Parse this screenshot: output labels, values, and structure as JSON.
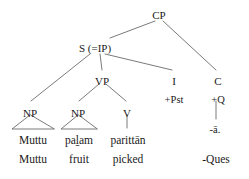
{
  "figure": {
    "type": "syntax-tree",
    "language_example": "Tamil",
    "canvas": {
      "width": 249,
      "height": 179
    },
    "line_color": "#6b6b6b",
    "text_color": "#1a1a1a",
    "background_color": "#ffffff"
  },
  "nodes": {
    "cp": {
      "label": "CP",
      "x": 159,
      "y": 10
    },
    "s_ip": {
      "label": "S (=IP)",
      "x": 95,
      "y": 43
    },
    "vp": {
      "label": "VP",
      "x": 102,
      "y": 76
    },
    "i": {
      "label": "I",
      "x": 174,
      "y": 76
    },
    "c": {
      "label": "C",
      "x": 218,
      "y": 76
    },
    "np1": {
      "label": "NP",
      "x": 30,
      "y": 108
    },
    "np2": {
      "label": "NP",
      "x": 78,
      "y": 108
    },
    "v": {
      "label": "V",
      "x": 127,
      "y": 108
    }
  },
  "features": {
    "i_feature": {
      "label": "+Pst",
      "x": 174,
      "y": 94
    },
    "c_feature": {
      "label": "+Q",
      "x": 218,
      "y": 94
    },
    "c_morpheme": {
      "label": "-ā.",
      "x": 215,
      "y": 124
    }
  },
  "terminals": [
    {
      "label": "Muttu",
      "x": 33,
      "y": 134
    },
    {
      "label": "pal̠am",
      "x": 79,
      "y": 134
    },
    {
      "label": "parittān",
      "x": 128,
      "y": 134
    }
  ],
  "glosses": [
    {
      "label": "Muttu",
      "x": 33,
      "y": 153
    },
    {
      "label": "fruit",
      "x": 79,
      "y": 153
    },
    {
      "label": "picked",
      "x": 128,
      "y": 153
    },
    {
      "label": "-Ques",
      "x": 216,
      "y": 153
    }
  ]
}
